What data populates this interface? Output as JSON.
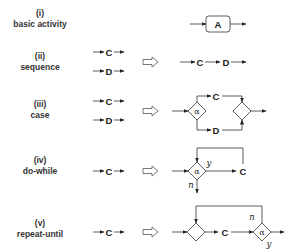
{
  "rows": [
    {
      "numeral": "(i)",
      "name": "basic activity",
      "input": [],
      "output": [
        "A"
      ]
    },
    {
      "numeral": "(ii)",
      "name": "sequence",
      "input": [
        "C",
        "D"
      ],
      "output": [
        "C",
        "D"
      ]
    },
    {
      "numeral": "(iii)",
      "name": "case",
      "input": [
        "C",
        "D"
      ],
      "output": [
        "α",
        "C",
        "D"
      ]
    },
    {
      "numeral": "(iv)",
      "name": "do-while",
      "input": [
        "C"
      ],
      "output": [
        "α",
        "y",
        "n",
        "C"
      ]
    },
    {
      "numeral": "(v)",
      "name": "repeat-until",
      "input": [
        "C"
      ],
      "output": [
        "C",
        "α",
        "n",
        "y"
      ]
    }
  ],
  "symbols": {
    "A": "A",
    "C": "C",
    "D": "D",
    "alpha": "α",
    "yes": "y",
    "no": "n"
  }
}
